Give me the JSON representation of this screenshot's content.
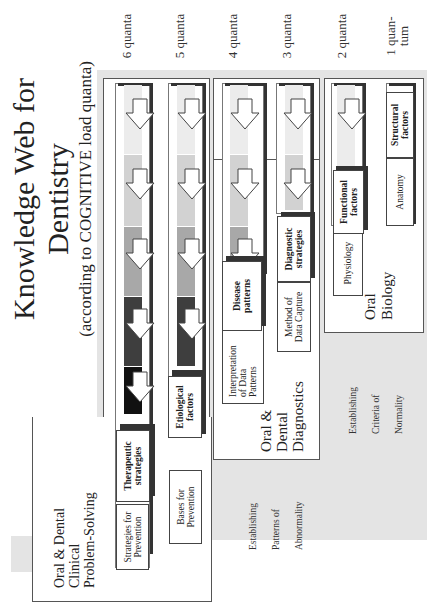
{
  "title": {
    "line1": "Knowledge Web for",
    "line2": "Dentistry",
    "subtitle": "(according to COGNITIVE load quanta)"
  },
  "quanta_labels": [
    "6 quanta",
    "5 quanta",
    "4 quanta",
    "3 quanta",
    "2 quanta",
    "1 quan-\ntum"
  ],
  "quanta_label_1a": "1 quan-",
  "quanta_label_1b": "tum",
  "sections": {
    "clinical": {
      "title_lines": [
        "Oral & Dental",
        "Clinical",
        "Problem-Solving"
      ]
    },
    "diagnostics": {
      "title_lines": [
        "Oral &",
        "Dental",
        "Diagnostics"
      ],
      "side_lines": [
        "Establishing",
        "Patterns of",
        "Abnormality"
      ]
    },
    "biology": {
      "title_lines": [
        "Oral",
        "Biology"
      ],
      "side_lines": [
        "Establishing",
        "Criteria of",
        "Normality"
      ]
    }
  },
  "boxes": {
    "strategies_for_prevention": [
      "Strategies for",
      "Prevention"
    ],
    "therapeutic_strategies": [
      "Therapeutic",
      "strategies"
    ],
    "bases_for_prevention": [
      "Bases for",
      "Prevention"
    ],
    "etiological_factors": [
      "Etiological",
      "factors"
    ],
    "interpretation": [
      "Interpretation",
      "of Data",
      "Patterns"
    ],
    "disease_patterns": [
      "Disease",
      "patterns"
    ],
    "method_data_capture": [
      "Method of",
      "Data Capture"
    ],
    "diagnostic_strategies": [
      "Diagnostic",
      "strategies"
    ],
    "physiology": [
      "Physiology"
    ],
    "functional_factors": [
      "Functional",
      "factors"
    ],
    "anatomy": [
      "Anatomy"
    ],
    "structural_factors": [
      "Structural",
      "factors"
    ]
  },
  "colors": {
    "panel_gray": "#e4e4e4",
    "band_1": "#ececec",
    "band_2": "#d2d2d2",
    "band_3": "#a8a8a8",
    "band_4": "#3e3e3e",
    "band_5": "#111111",
    "shadow": "#333333"
  }
}
